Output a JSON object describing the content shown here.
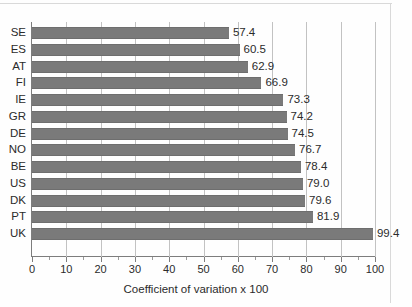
{
  "chart_data": {
    "type": "bar",
    "orientation": "horizontal",
    "title": "",
    "xlabel": "Coefficient of variation x 100",
    "ylabel": "",
    "xlim": [
      0,
      105
    ],
    "xticks": [
      0,
      10,
      20,
      30,
      40,
      50,
      60,
      70,
      80,
      90,
      100
    ],
    "xtick_labels": [
      "0",
      "10",
      "20",
      "30",
      "40",
      "50",
      "60",
      "70",
      "80",
      "90",
      "100"
    ],
    "minor_tick_step": 5,
    "grid": "vertical-major",
    "legend": "none",
    "bar_color": "#7a7a7a",
    "categories": [
      "SE",
      "ES",
      "AT",
      "FI",
      "IE",
      "GR",
      "DE",
      "NO",
      "BE",
      "US",
      "DK",
      "PT",
      "UK"
    ],
    "values": [
      57.4,
      60.5,
      62.9,
      66.9,
      73.3,
      74.2,
      74.5,
      76.7,
      78.4,
      79.0,
      79.6,
      81.9,
      99.4
    ],
    "value_labels": [
      "57.4",
      "60.5",
      "62.9",
      "66.9",
      "73.3",
      "74.2",
      "74.5",
      "76.7",
      "78.4",
      "79.0",
      "79.6",
      "81.9",
      "99.4"
    ]
  }
}
